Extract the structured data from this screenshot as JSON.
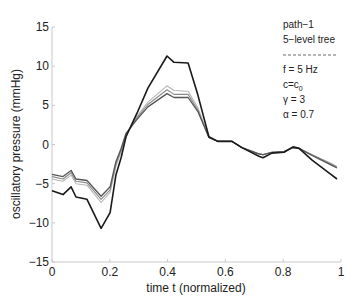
{
  "chart_data": {
    "type": "line",
    "title": "",
    "xlabel": "time t (normalized)",
    "ylabel": "oscillatory pressure (mmHg)",
    "xlim": [
      0,
      1
    ],
    "ylim": [
      -15,
      15
    ],
    "xticks": [
      0,
      0.2,
      0.4,
      0.6,
      0.8,
      1
    ],
    "xtick_labels": [
      "0",
      "0.2",
      "0.4",
      "0.6",
      "0.8",
      "1"
    ],
    "yticks": [
      -15,
      -10,
      -5,
      0,
      5,
      10,
      15
    ],
    "ytick_labels": [
      "−15",
      "−10",
      "−5",
      "0",
      "5",
      "10",
      "15"
    ],
    "grid": false,
    "annotation": {
      "lines": [
        "path−1",
        "5−level tree",
        "−−−−−−−−−−",
        "f = 5 Hz",
        "c=c0",
        "γ = 3",
        "α = 0.7"
      ],
      "position": "top-right"
    },
    "series": [
      {
        "name": "black",
        "color": "#1a1a1a",
        "width": 1.6,
        "x": [
          0,
          0.038,
          0.066,
          0.083,
          0.121,
          0.17,
          0.201,
          0.221,
          0.239,
          0.256,
          0.294,
          0.332,
          0.398,
          0.422,
          0.471,
          0.505,
          0.543,
          0.574,
          0.623,
          0.657,
          0.716,
          0.73,
          0.761,
          0.803,
          0.834,
          0.855,
          0.9,
          0.965,
          0.986
        ],
        "y": [
          -5.9,
          -6.4,
          -5.4,
          -6.7,
          -7.0,
          -10.7,
          -8.7,
          -3.9,
          -1.7,
          1.0,
          4.0,
          7.2,
          11.3,
          10.5,
          10.4,
          6.3,
          1.0,
          0.4,
          0.4,
          -0.4,
          -1.5,
          -1.7,
          -1.1,
          -1.0,
          -0.3,
          -0.5,
          -2.0,
          -3.8,
          -4.4
        ]
      },
      {
        "name": "dark-gray",
        "color": "#555555",
        "width": 1.3,
        "x": [
          0,
          0.038,
          0.066,
          0.083,
          0.121,
          0.17,
          0.201,
          0.221,
          0.239,
          0.256,
          0.294,
          0.332,
          0.398,
          0.422,
          0.471,
          0.505,
          0.543,
          0.574,
          0.623,
          0.657,
          0.716,
          0.73,
          0.761,
          0.803,
          0.834,
          0.855,
          0.9,
          0.965,
          0.986
        ],
        "y": [
          -3.8,
          -4.1,
          -3.3,
          -4.4,
          -4.6,
          -6.6,
          -5.4,
          -2.2,
          -0.5,
          1.4,
          3.2,
          4.8,
          6.5,
          6.0,
          6.0,
          4.2,
          0.9,
          0.4,
          0.4,
          -0.4,
          -1.2,
          -1.3,
          -1.0,
          -0.9,
          -0.4,
          -0.5,
          -1.4,
          -2.6,
          -3.0
        ]
      },
      {
        "name": "mid-gray",
        "color": "#8a8a8a",
        "width": 1.1,
        "x": [
          0,
          0.038,
          0.066,
          0.083,
          0.121,
          0.17,
          0.201,
          0.221,
          0.239,
          0.256,
          0.294,
          0.332,
          0.398,
          0.422,
          0.471,
          0.505,
          0.543,
          0.574,
          0.623,
          0.657,
          0.716,
          0.73,
          0.761,
          0.803,
          0.834,
          0.855,
          0.9,
          0.965,
          0.986
        ],
        "y": [
          -4.1,
          -4.4,
          -3.6,
          -4.7,
          -4.9,
          -7.0,
          -5.8,
          -2.5,
          -0.7,
          1.3,
          3.4,
          5.1,
          7.0,
          6.4,
          6.4,
          4.4,
          0.9,
          0.4,
          0.4,
          -0.4,
          -1.2,
          -1.3,
          -1.0,
          -0.9,
          -0.4,
          -0.5,
          -1.3,
          -2.5,
          -2.9
        ]
      },
      {
        "name": "light-gray",
        "color": "#b4b4b4",
        "width": 1.1,
        "x": [
          0,
          0.038,
          0.066,
          0.083,
          0.121,
          0.17,
          0.201,
          0.221,
          0.239,
          0.256,
          0.294,
          0.332,
          0.398,
          0.422,
          0.471,
          0.505,
          0.543,
          0.574,
          0.623,
          0.657,
          0.716,
          0.73,
          0.761,
          0.803,
          0.834,
          0.855,
          0.9,
          0.965,
          0.986
        ],
        "y": [
          -4.4,
          -4.7,
          -3.9,
          -5.0,
          -5.2,
          -7.4,
          -6.1,
          -2.8,
          -0.9,
          1.2,
          3.6,
          5.4,
          7.5,
          6.9,
          6.8,
          4.7,
          0.9,
          0.4,
          0.4,
          -0.4,
          -1.2,
          -1.3,
          -1.0,
          -0.9,
          -0.4,
          -0.5,
          -1.3,
          -2.4,
          -2.8
        ]
      }
    ]
  }
}
